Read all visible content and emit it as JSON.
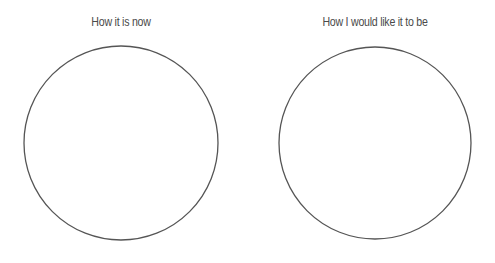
{
  "panels": [
    {
      "title": "How it is now",
      "circle": {
        "cx": 121,
        "cy": 143,
        "r": 97
      }
    },
    {
      "title": "How I would like it to be",
      "circle": {
        "cx": 375,
        "cy": 143,
        "r": 96
      }
    }
  ],
  "colors": {
    "stroke": "#555555",
    "text": "#4a4a4a",
    "background": "#ffffff"
  }
}
